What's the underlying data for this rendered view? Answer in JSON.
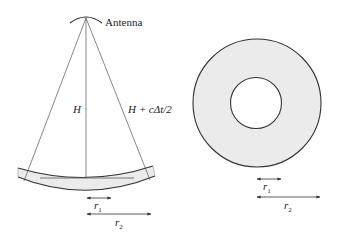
{
  "colors": {
    "stroke": "#333333",
    "fill": "#ebebeb",
    "thin_line": "#555555",
    "background": "#ffffff"
  },
  "left_diagram": {
    "antenna_label": "Antenna",
    "nadir_label": "H",
    "slant_label": "H + cΔt/2",
    "r1_label": "r",
    "r1_sub": "1",
    "r2_label": "r",
    "r2_sub": "2"
  },
  "right_diagram": {
    "r1_label": "r",
    "r1_sub": "1",
    "r2_label": "r",
    "r2_sub": "2"
  }
}
